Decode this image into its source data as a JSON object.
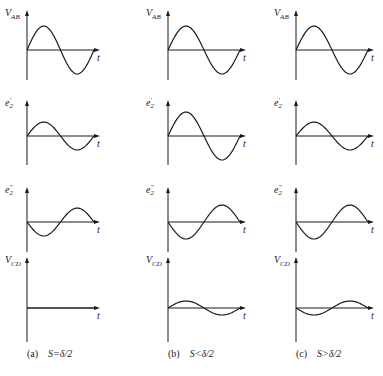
{
  "figure": {
    "columns": [
      {
        "id": "a",
        "caption_prefix": "(a)",
        "caption_condition": "S=δ/2",
        "axis_x": 27,
        "t_end": 100,
        "vcd_amplitude": 0
      },
      {
        "id": "b",
        "caption_prefix": "(b)",
        "caption_condition": "S<δ/2",
        "axis_x": 168,
        "t_end": 246,
        "vcd_amplitude": 7
      },
      {
        "id": "c",
        "caption_prefix": "(c)",
        "caption_condition": "S>δ/2",
        "axis_x": 296,
        "t_end": 374,
        "vcd_amplitude": -7
      }
    ],
    "rows": [
      {
        "id": "vab",
        "label_main": "V",
        "label_sub": "AB",
        "label_sup": "",
        "axis_y": 50,
        "top": 10,
        "bottom": 80
      },
      {
        "id": "e2p",
        "label_main": "e",
        "label_sub": "2",
        "label_sup": "′",
        "axis_y": 136,
        "top": 100,
        "bottom": 165
      },
      {
        "id": "e2pp",
        "label_main": "e",
        "label_sub": "2",
        "label_sup": "″",
        "axis_y": 222,
        "top": 187,
        "bottom": 252
      },
      {
        "id": "vcd",
        "label_main": "V",
        "label_sub": "CD",
        "label_sup": "",
        "axis_y": 308,
        "top": 257,
        "bottom": 342
      }
    ],
    "amplitudes": {
      "a": {
        "vab": 24,
        "e2p": 14,
        "e2pp": -14,
        "vcd": 0
      },
      "b": {
        "vab": 24,
        "e2p": 24,
        "e2pp": -17,
        "vcd": 7
      },
      "c": {
        "vab": 24,
        "e2p": 14,
        "e2pp": -17,
        "vcd": -7
      }
    },
    "time_axis_label": "t",
    "caption_y": 354
  }
}
